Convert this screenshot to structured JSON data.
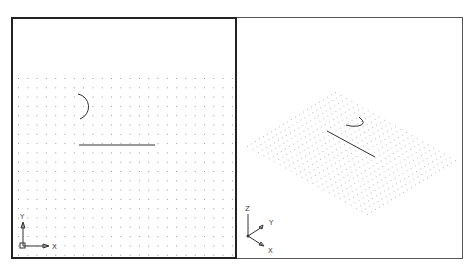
{
  "viewports": [
    {
      "name": "Top (Plan) view",
      "active": true,
      "ucs": {
        "x_label": "X",
        "y_label": "Y"
      },
      "grid": {
        "x0": 18,
        "y0": 78,
        "cols": 24,
        "rows": 20,
        "spacing": 9.3
      }
    },
    {
      "name": "SE Isometric view",
      "active": false,
      "ucs": {
        "x_label": "X",
        "y_label": "Y",
        "z_label": "Z"
      },
      "grid": {
        "top": [
          335,
          92
        ],
        "left": [
          247,
          146
        ],
        "right": [
          455,
          160
        ],
        "bottom": [
          365,
          215
        ],
        "divisions": 22
      }
    }
  ],
  "colors": {
    "border_active": "#222222",
    "border_inactive": "#555555",
    "grid_dot": "#9a9a9a",
    "geometry": "#333333"
  }
}
